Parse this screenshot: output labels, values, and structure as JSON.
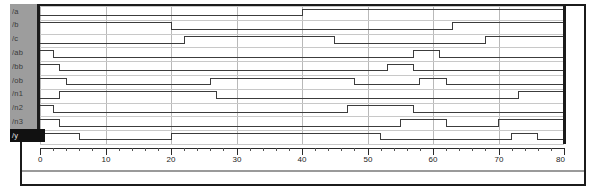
{
  "window": {
    "title": "Waveform Viewer",
    "background_color": "#ffffff",
    "frame_color": "#1b1b1b",
    "label_panel_color": "#9d9d9d",
    "grid_color": "#b9b9b9",
    "trace_color": "#3c3c3c",
    "selected_label_bg": "#111111",
    "selected_label_fg": "#e8e8e8"
  },
  "signals": [
    {
      "name": "/a",
      "selected": false
    },
    {
      "name": "/b",
      "selected": false
    },
    {
      "name": "/c",
      "selected": false
    },
    {
      "name": "/ab",
      "selected": false
    },
    {
      "name": "/bb",
      "selected": false
    },
    {
      "name": "/ob",
      "selected": false
    },
    {
      "name": "/n1",
      "selected": false
    },
    {
      "name": "/n2",
      "selected": false
    },
    {
      "name": "/n3",
      "selected": false
    },
    {
      "name": "/y",
      "selected": true
    }
  ],
  "timeline": {
    "start": 0,
    "end": 80,
    "major_step": 10,
    "minor_step": 2,
    "tick_labels": [
      "0",
      "10",
      "20",
      "30",
      "40",
      "50",
      "60",
      "70",
      "80"
    ]
  },
  "chart_data": {
    "type": "line",
    "xlabel": "time",
    "ylabel": "",
    "xlim": [
      0,
      80
    ],
    "grid": true,
    "legend": "left label panel",
    "series": [
      {
        "name": "/a",
        "transitions": [
          [
            0,
            0
          ],
          [
            40,
            1
          ]
        ]
      },
      {
        "name": "/b",
        "transitions": [
          [
            0,
            1
          ],
          [
            20,
            0
          ],
          [
            63,
            1
          ]
        ]
      },
      {
        "name": "/c",
        "transitions": [
          [
            0,
            0
          ],
          [
            22,
            1
          ],
          [
            45,
            0
          ],
          [
            68,
            1
          ]
        ]
      },
      {
        "name": "/ab",
        "transitions": [
          [
            0,
            1
          ],
          [
            2,
            0
          ],
          [
            57,
            1
          ],
          [
            61,
            0
          ]
        ]
      },
      {
        "name": "/bb",
        "transitions": [
          [
            0,
            1
          ],
          [
            3,
            0
          ],
          [
            53,
            1
          ],
          [
            57,
            0
          ]
        ]
      },
      {
        "name": "/ob",
        "transitions": [
          [
            0,
            1
          ],
          [
            4,
            0
          ],
          [
            26,
            1
          ],
          [
            48,
            0
          ],
          [
            58,
            1
          ],
          [
            62,
            0
          ]
        ]
      },
      {
        "name": "/n1",
        "transitions": [
          [
            0,
            0
          ],
          [
            3,
            1
          ],
          [
            27,
            0
          ],
          [
            73,
            1
          ]
        ]
      },
      {
        "name": "/n2",
        "transitions": [
          [
            0,
            1
          ],
          [
            2,
            0
          ],
          [
            47,
            1
          ],
          [
            57,
            0
          ]
        ]
      },
      {
        "name": "/n3",
        "transitions": [
          [
            0,
            1
          ],
          [
            3,
            0
          ],
          [
            55,
            1
          ],
          [
            62,
            0
          ],
          [
            70,
            1
          ]
        ]
      },
      {
        "name": "/y",
        "transitions": [
          [
            0,
            1
          ],
          [
            6,
            0
          ],
          [
            20,
            1
          ],
          [
            52,
            0
          ],
          [
            72,
            1
          ],
          [
            76,
            0
          ]
        ]
      }
    ]
  }
}
